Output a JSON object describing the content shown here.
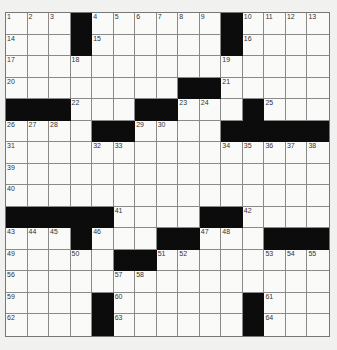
{
  "puzzle": {
    "rows": 15,
    "cols": 15,
    "grid": [
      [
        "1",
        "2",
        "3",
        "#",
        "4",
        "5",
        "6",
        "7",
        "8",
        "9",
        "#",
        "10",
        "11",
        "12",
        "13"
      ],
      [
        "14",
        "",
        "",
        "#",
        "15",
        "",
        "",
        "",
        "",
        "",
        "#",
        "16",
        "",
        "",
        ""
      ],
      [
        "17",
        "",
        "",
        "18",
        "",
        "",
        "",
        "",
        "",
        "",
        "19",
        "",
        "",
        "",
        ""
      ],
      [
        "20",
        "",
        "",
        "",
        "",
        "",
        "",
        "",
        "#",
        "#",
        "21",
        "",
        "",
        "",
        ""
      ],
      [
        "#",
        "#",
        "#",
        "22",
        "",
        "",
        "#",
        "#",
        "23",
        "24",
        "",
        "#",
        "25",
        "",
        ""
      ],
      [
        "26",
        "27",
        "28",
        "",
        "#",
        "#",
        "29",
        "30",
        "",
        "",
        "#",
        "#",
        "#",
        "#",
        "#"
      ],
      [
        "31",
        "",
        "",
        "",
        "32",
        "33",
        "",
        "",
        "",
        "",
        "34",
        "35",
        "36",
        "37",
        "38"
      ],
      [
        "39",
        "",
        "",
        "",
        "",
        "",
        "",
        "",
        "",
        "",
        "",
        "",
        "",
        "",
        ""
      ],
      [
        "40",
        "",
        "",
        "",
        "",
        "",
        "",
        "",
        "",
        "",
        "",
        "",
        "",
        "",
        ""
      ],
      [
        "#",
        "#",
        "#",
        "#",
        "#",
        "41",
        "",
        "",
        "",
        "#",
        "#",
        "42",
        "",
        "",
        ""
      ],
      [
        "43",
        "44",
        "45",
        "#",
        "46",
        "",
        "",
        "#",
        "#",
        "47",
        "48",
        "",
        "#",
        "#",
        "#"
      ],
      [
        "49",
        "",
        "",
        "50",
        "",
        "#",
        "#",
        "51",
        "52",
        "",
        "",
        "",
        "53",
        "54",
        "55"
      ],
      [
        "56",
        "",
        "",
        "",
        "",
        "57",
        "58",
        "",
        "",
        "",
        "",
        "",
        "",
        "",
        ""
      ],
      [
        "59",
        "",
        "",
        "",
        "#",
        "60",
        "",
        "",
        "",
        "",
        "",
        "#",
        "61",
        "",
        ""
      ],
      [
        "62",
        "",
        "",
        "",
        "#",
        "63",
        "",
        "",
        "",
        "",
        "",
        "#",
        "64",
        "",
        ""
      ]
    ]
  },
  "colors": {
    "background": "#f1f1ef",
    "cell": "#fafaf8",
    "block": "#0c0c0c",
    "gridline": "#8a8a8a"
  }
}
